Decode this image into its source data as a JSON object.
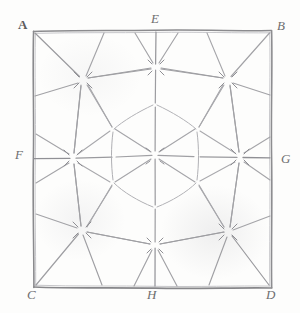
{
  "figure": {
    "kind": "hand-drawn-pencil-geometry-sketch",
    "medium_colors": {
      "paper": "#fdfdfc",
      "pencil_dark": "#8d8d90",
      "pencil_mid": "#a9a9ad",
      "pencil_light": "#c3c3c7",
      "label_ink": "#6e6e70"
    },
    "frame": {
      "shape": "square",
      "left": 33,
      "top": 30,
      "right": 272,
      "bottom": 288
    },
    "labels": [
      {
        "text": "A",
        "x": 18,
        "y": 18,
        "style": "upright",
        "anchor": "top-left-corner"
      },
      {
        "text": "B",
        "x": 277,
        "y": 19,
        "style": "italic",
        "anchor": "top-right-corner"
      },
      {
        "text": "C",
        "x": 27,
        "y": 288,
        "style": "italic",
        "anchor": "bottom-left-corner"
      },
      {
        "text": "D",
        "x": 266,
        "y": 288,
        "style": "italic",
        "anchor": "bottom-right-corner"
      },
      {
        "text": "E",
        "x": 151,
        "y": 12,
        "style": "italic",
        "anchor": "top-edge-midpoint"
      },
      {
        "text": "F",
        "x": 15,
        "y": 148,
        "style": "italic",
        "anchor": "left-edge-midpoint"
      },
      {
        "text": "G",
        "x": 281,
        "y": 152,
        "style": "italic",
        "anchor": "right-edge-midpoint"
      },
      {
        "text": "H",
        "x": 147,
        "y": 288,
        "style": "italic",
        "anchor": "bottom-edge-midpoint"
      }
    ],
    "nodes": [
      {
        "name": "center",
        "x": 155,
        "y": 155,
        "rays": 12
      },
      {
        "name": "upper-left-star",
        "x": 83,
        "y": 80,
        "rays": 6
      },
      {
        "name": "top-star",
        "x": 156,
        "y": 67,
        "rays": 6
      },
      {
        "name": "upper-right-star",
        "x": 228,
        "y": 80,
        "rays": 6
      },
      {
        "name": "left-star",
        "x": 73,
        "y": 158,
        "rays": 6
      },
      {
        "name": "right-star",
        "x": 240,
        "y": 157,
        "rays": 6
      },
      {
        "name": "lower-left-star",
        "x": 82,
        "y": 230,
        "rays": 6
      },
      {
        "name": "bottom-star",
        "x": 155,
        "y": 245,
        "rays": 6
      },
      {
        "name": "lower-right-star",
        "x": 228,
        "y": 232,
        "rays": 6
      }
    ],
    "inner_ring_vertices": [
      {
        "x": 155,
        "y": 105
      },
      {
        "x": 197,
        "y": 130
      },
      {
        "x": 197,
        "y": 182
      },
      {
        "x": 155,
        "y": 207
      },
      {
        "x": 113,
        "y": 182
      },
      {
        "x": 113,
        "y": 130
      }
    ]
  }
}
